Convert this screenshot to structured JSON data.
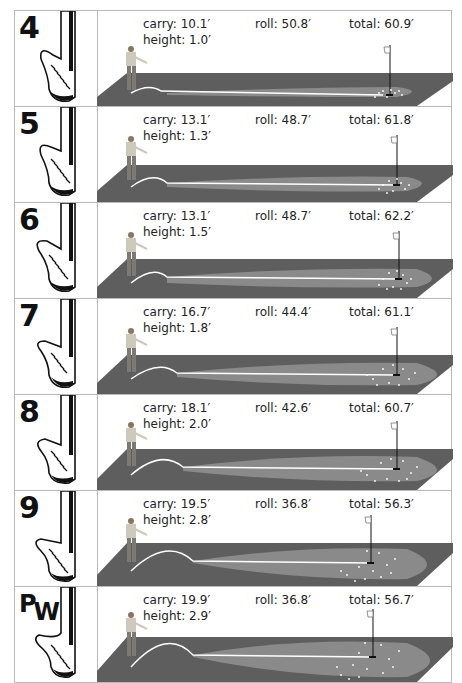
{
  "colors": {
    "ground": "#5e5e5e",
    "roll_area": "#8a8a8a",
    "trajectory": "#ffffff",
    "border": "#b9b9b9",
    "text": "#222222"
  },
  "rows": [
    {
      "club": "4",
      "carry": "carry: 10.1′",
      "height": "height: 1.0′",
      "roll": "roll: 50.8′",
      "total": "total: 60.9′"
    },
    {
      "club": "5",
      "carry": "carry: 13.1′",
      "height": "height: 1.3′",
      "roll": "roll: 48.7′",
      "total": "total: 61.8′"
    },
    {
      "club": "6",
      "carry": "carry: 13.1′",
      "height": "height: 1.5′",
      "roll": "roll: 48.7′",
      "total": "total: 62.2′"
    },
    {
      "club": "7",
      "carry": "carry: 16.7′",
      "height": "height: 1.8′",
      "roll": "roll: 44.4′",
      "total": "total: 61.1′"
    },
    {
      "club": "8",
      "carry": "carry: 18.1′",
      "height": "height: 2.0′",
      "roll": "roll: 42.6′",
      "total": "total: 60.7′"
    },
    {
      "club": "9",
      "carry": "carry: 19.5′",
      "height": "height: 2.8′",
      "roll": "roll: 36.8′",
      "total": "total: 56.3′"
    },
    {
      "club_p": "P",
      "club_w": "W",
      "carry": "carry: 19.9′",
      "height": "height: 2.9′",
      "roll": "roll: 36.8′",
      "total": "total: 56.7′"
    }
  ],
  "icons": [
    "club-head-icon",
    "golfer-icon",
    "flag-icon",
    "ball-trajectory-icon"
  ]
}
